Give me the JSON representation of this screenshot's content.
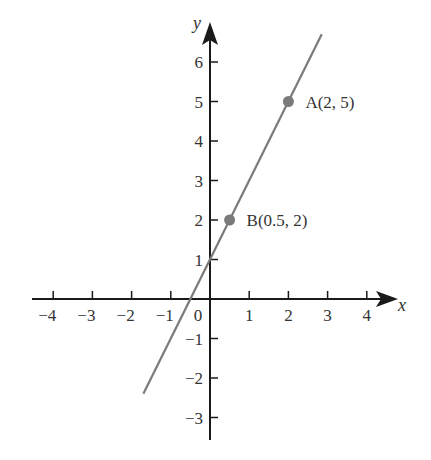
{
  "chart_data": {
    "type": "line",
    "title": "",
    "xlabel": "x",
    "ylabel": "y",
    "xlim": [
      -4.3,
      4.5
    ],
    "ylim": [
      -3.5,
      6.7
    ],
    "grid": false,
    "x_ticks": [
      -4,
      -3,
      -2,
      -1,
      0,
      1,
      2,
      3,
      4
    ],
    "x_tick_labels": [
      "−4",
      "−3",
      "−2",
      "−1",
      "0",
      "1",
      "2",
      "3",
      "4"
    ],
    "y_ticks": [
      -3,
      -2,
      -1,
      1,
      2,
      3,
      4,
      5,
      6
    ],
    "y_tick_labels": [
      "−3",
      "−2",
      "−1",
      "1",
      "2",
      "3",
      "4",
      "5",
      "6"
    ],
    "series": [
      {
        "name": "line through A and B",
        "equation": "y = 2x + 1",
        "x": [
          -1.7,
          2.85
        ],
        "y": [
          -2.4,
          6.7
        ],
        "color": "#7a7a7a"
      }
    ],
    "points": [
      {
        "label": "A(2, 5)",
        "x": 2,
        "y": 5,
        "color": "#7a7a7a"
      },
      {
        "label": "B(0.5, 2)",
        "x": 0.5,
        "y": 2,
        "color": "#7a7a7a"
      }
    ],
    "annotations": [
      "A(2, 5)",
      "B(0.5, 2)"
    ]
  },
  "colors": {
    "axis": "#1a1a1a",
    "line": "#7a7a7a",
    "text": "#333333",
    "background": "#ffffff"
  }
}
